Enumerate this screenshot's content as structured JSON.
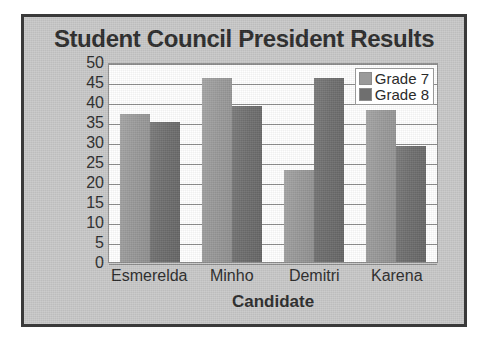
{
  "chart_data": {
    "type": "bar",
    "title": "Student Council President Results",
    "xlabel": "Candidate",
    "ylabel": "Number of Votes",
    "categories": [
      "Esmerelda",
      "Minho",
      "Demitri",
      "Karena"
    ],
    "series": [
      {
        "name": "Grade 7",
        "color": "#9a9a9a",
        "values": [
          37,
          46,
          23,
          38
        ]
      },
      {
        "name": "Grade 8",
        "color": "#6f6f6f",
        "values": [
          35,
          39,
          46,
          29
        ]
      }
    ],
    "ylim": [
      0,
      50
    ],
    "ytick_step": 5,
    "yticks": [
      50,
      45,
      40,
      35,
      30,
      25,
      20,
      15,
      10,
      5,
      0
    ],
    "grid": "horizontal",
    "legend_position": "top-right",
    "plot_background": "#ffffff",
    "card_background": "#c9c9c9",
    "border_color": "#3a3a3a",
    "text_color": "#2b2b2b"
  }
}
